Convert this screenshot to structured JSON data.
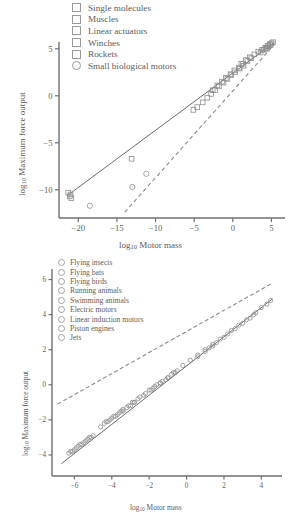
{
  "chart_data": [
    {
      "type": "scatter",
      "id": "top-panel",
      "title": "",
      "xlabel": "log10 Motor mass",
      "ylabel": "log10 Maximum force output",
      "xlim": [
        -22.5,
        6.5
      ],
      "ylim": [
        -13.0,
        7.0
      ],
      "xticks": [
        -20,
        -15,
        -10,
        -5,
        0,
        5
      ],
      "xticklabels": [
        "−20",
        "−15",
        "−10",
        "−5",
        "0",
        "5"
      ],
      "yticks": [
        5,
        0,
        -5,
        -10
      ],
      "yticklabels": [
        "5",
        "0",
        "−5",
        "−10"
      ],
      "grid": false,
      "legend_position": "top-center",
      "legend": [
        {
          "label": "Single molecules",
          "marker": "square"
        },
        {
          "label": "Muscles",
          "marker": "square"
        },
        {
          "label": "Linear actuators",
          "marker": "square"
        },
        {
          "label": "Winches",
          "marker": "square"
        },
        {
          "label": "Rockets",
          "marker": "square"
        },
        {
          "label": "Small biological motors",
          "marker": "circle"
        }
      ],
      "series": [
        {
          "name": "Single molecules",
          "marker": "square",
          "points": [
            [
              -21.3,
              -10.3
            ],
            [
              -21.1,
              -10.7
            ],
            [
              -20.9,
              -10.9
            ],
            [
              -21.0,
              -10.5
            ]
          ]
        },
        {
          "name": "Small biological motors",
          "marker": "circle",
          "points": [
            [
              -18.5,
              -11.7
            ],
            [
              -13.0,
              -9.7
            ],
            [
              -11.2,
              -8.3
            ]
          ]
        },
        {
          "name": "Muscles",
          "marker": "square",
          "points": [
            [
              -13.1,
              -6.7
            ],
            [
              -5.1,
              -1.5
            ],
            [
              -4.6,
              -1.2
            ],
            [
              -3.9,
              -0.7
            ],
            [
              -3.3,
              -0.2
            ],
            [
              -2.8,
              0.2
            ],
            [
              -2.3,
              0.6
            ],
            [
              -1.8,
              1.0
            ],
            [
              -1.2,
              1.4
            ],
            [
              -0.7,
              1.8
            ],
            [
              -0.2,
              2.2
            ],
            [
              0.3,
              2.5
            ],
            [
              0.9,
              2.9
            ],
            [
              1.4,
              3.2
            ]
          ]
        },
        {
          "name": "Linear actuators",
          "marker": "square",
          "points": [
            [
              -2.6,
              0.6
            ],
            [
              -2.0,
              1.1
            ],
            [
              -1.4,
              1.5
            ],
            [
              -0.9,
              1.9
            ],
            [
              -0.3,
              2.3
            ],
            [
              0.2,
              2.7
            ],
            [
              0.8,
              3.0
            ],
            [
              1.3,
              3.4
            ],
            [
              1.9,
              3.7
            ],
            [
              2.4,
              4.0
            ]
          ]
        },
        {
          "name": "Winches",
          "marker": "square",
          "points": [
            [
              1.1,
              3.4
            ],
            [
              1.7,
              3.8
            ],
            [
              2.2,
              4.1
            ],
            [
              2.8,
              4.4
            ],
            [
              3.3,
              4.7
            ],
            [
              3.8,
              4.9
            ],
            [
              4.2,
              5.1
            ],
            [
              4.5,
              5.3
            ]
          ]
        },
        {
          "name": "Rockets",
          "marker": "square",
          "points": [
            [
              3.6,
              4.6
            ],
            [
              4.0,
              4.9
            ],
            [
              4.3,
              5.1
            ],
            [
              4.6,
              5.3
            ],
            [
              4.8,
              5.5
            ],
            [
              5.0,
              5.6
            ],
            [
              5.2,
              5.7
            ],
            [
              4.4,
              5.0
            ],
            [
              4.9,
              5.4
            ]
          ]
        }
      ],
      "lines": [
        {
          "name": "regression-line",
          "style": "solid",
          "x": [
            -21.4,
            5.4
          ],
          "y": [
            -10.6,
            5.7
          ]
        },
        {
          "name": "isometric-reference-line",
          "style": "dashed",
          "x": [
            -14.0,
            5.4
          ],
          "y": [
            -12.4,
            5.5
          ]
        }
      ]
    },
    {
      "type": "scatter",
      "id": "bottom-panel",
      "title": "",
      "xlabel": "log10 Motor mass",
      "ylabel": "log10 Maximum force output",
      "xlim": [
        -7.2,
        5.0
      ],
      "ylim": [
        -5.2,
        6.6
      ],
      "xticks": [
        -6,
        -4,
        -2,
        0,
        2,
        4
      ],
      "xticklabels": [
        "−6",
        "−4",
        "−2",
        "0",
        "2",
        "4"
      ],
      "yticks": [
        6,
        4,
        2,
        0,
        -2,
        -4
      ],
      "yticklabels": [
        "6",
        "4",
        "2",
        "0",
        "−2",
        "−4"
      ],
      "grid": false,
      "legend_position": "top-left",
      "legend": [
        {
          "label": "Flying insects",
          "marker": "circle"
        },
        {
          "label": "Flying bats",
          "marker": "circle"
        },
        {
          "label": "Flying birds",
          "marker": "circle"
        },
        {
          "label": "Running animals",
          "marker": "circle"
        },
        {
          "label": "Swimming animals",
          "marker": "circle"
        },
        {
          "label": "Electric motors",
          "marker": "circle"
        },
        {
          "label": "Linear induction motors",
          "marker": "circle"
        },
        {
          "label": "Piston engines",
          "marker": "circle"
        },
        {
          "label": "Jets",
          "marker": "circle"
        }
      ],
      "series": [
        {
          "name": "Flying insects",
          "marker": "circle",
          "points": [
            [
              -6.3,
              -3.9
            ],
            [
              -6.2,
              -3.8
            ],
            [
              -6.1,
              -3.8
            ],
            [
              -6.0,
              -3.7
            ],
            [
              -5.9,
              -3.6
            ],
            [
              -5.8,
              -3.5
            ],
            [
              -5.7,
              -3.4
            ],
            [
              -5.6,
              -3.4
            ],
            [
              -5.5,
              -3.3
            ],
            [
              -5.4,
              -3.2
            ],
            [
              -5.3,
              -3.1
            ],
            [
              -5.2,
              -3.0
            ],
            [
              -5.1,
              -3.0
            ],
            [
              -5.0,
              -2.9
            ]
          ]
        },
        {
          "name": "Flying bats",
          "marker": "circle",
          "points": [
            [
              -4.3,
              -2.1
            ],
            [
              -4.1,
              -2.0
            ],
            [
              -3.9,
              -1.8
            ],
            [
              -3.7,
              -1.7
            ],
            [
              -3.5,
              -1.5
            ]
          ]
        },
        {
          "name": "Flying birds",
          "marker": "circle",
          "points": [
            [
              -4.6,
              -2.4
            ],
            [
              -4.4,
              -2.2
            ],
            [
              -4.2,
              -2.1
            ],
            [
              -4.0,
              -1.9
            ],
            [
              -3.8,
              -1.8
            ],
            [
              -3.6,
              -1.6
            ],
            [
              -3.4,
              -1.5
            ],
            [
              -3.2,
              -1.3
            ],
            [
              -3.0,
              -1.2
            ],
            [
              -2.8,
              -1.0
            ]
          ]
        },
        {
          "name": "Running animals",
          "marker": "circle",
          "points": [
            [
              -3.4,
              -1.4
            ],
            [
              -3.1,
              -1.2
            ],
            [
              -2.8,
              -1.0
            ],
            [
              -2.5,
              -0.7
            ],
            [
              -2.2,
              -0.5
            ],
            [
              -1.9,
              -0.3
            ],
            [
              -1.6,
              0.0
            ],
            [
              -1.3,
              0.2
            ],
            [
              -1.0,
              0.4
            ],
            [
              -0.7,
              0.7
            ]
          ]
        },
        {
          "name": "Swimming animals",
          "marker": "circle",
          "points": [
            [
              -2.9,
              -1.0
            ],
            [
              -2.6,
              -0.8
            ],
            [
              -2.3,
              -0.6
            ],
            [
              -2.0,
              -0.3
            ],
            [
              -1.7,
              -0.1
            ],
            [
              -1.4,
              0.1
            ],
            [
              -1.1,
              0.3
            ],
            [
              -0.8,
              0.6
            ],
            [
              -0.5,
              0.8
            ]
          ]
        },
        {
          "name": "Electric motors",
          "marker": "circle",
          "points": [
            [
              -1.8,
              -0.2
            ],
            [
              -1.4,
              0.1
            ],
            [
              -1.0,
              0.4
            ],
            [
              -0.6,
              0.7
            ],
            [
              -0.2,
              1.1
            ],
            [
              0.2,
              1.4
            ],
            [
              0.6,
              1.7
            ],
            [
              1.0,
              2.0
            ],
            [
              1.4,
              2.3
            ]
          ]
        },
        {
          "name": "Linear induction motors",
          "marker": "circle",
          "points": [
            [
              0.6,
              1.6
            ],
            [
              1.0,
              1.9
            ],
            [
              1.4,
              2.2
            ],
            [
              1.8,
              2.6
            ],
            [
              2.2,
              2.9
            ]
          ]
        },
        {
          "name": "Piston engines",
          "marker": "circle",
          "points": [
            [
              1.2,
              2.1
            ],
            [
              1.6,
              2.4
            ],
            [
              2.0,
              2.7
            ],
            [
              2.4,
              3.1
            ],
            [
              2.8,
              3.4
            ],
            [
              3.2,
              3.7
            ],
            [
              3.6,
              4.0
            ]
          ]
        },
        {
          "name": "Jets",
          "marker": "circle",
          "points": [
            [
              2.6,
              3.2
            ],
            [
              3.0,
              3.5
            ],
            [
              3.4,
              3.8
            ],
            [
              3.7,
              4.1
            ],
            [
              4.0,
              4.4
            ],
            [
              4.3,
              4.6
            ],
            [
              4.5,
              4.8
            ]
          ]
        }
      ],
      "lines": [
        {
          "name": "regression-line",
          "style": "solid",
          "x": [
            -6.7,
            4.6
          ],
          "y": [
            -4.5,
            4.9
          ]
        },
        {
          "name": "isometric-reference-line",
          "style": "dashed",
          "x": [
            -6.9,
            4.6
          ],
          "y": [
            -1.1,
            5.8
          ]
        }
      ]
    }
  ],
  "panels": {
    "top": {
      "xlabel_main": "log",
      "xlabel_sub": "10",
      "xlabel_rest": " Motor mass",
      "ylabel_main": "log",
      "ylabel_sub": "10",
      "ylabel_rest": " Maximum force output"
    },
    "bottom": {
      "xlabel_main": "log",
      "xlabel_sub": "10",
      "xlabel_rest": " Motor mass",
      "ylabel_main": "log",
      "ylabel_sub": "10",
      "ylabel_rest": " Maximum force output"
    }
  }
}
